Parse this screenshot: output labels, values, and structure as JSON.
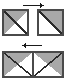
{
  "figure": {
    "canvas": {
      "width": 66,
      "height": 79
    },
    "background_color": "#ffffff"
  },
  "palette": {
    "shaded_fill": "#a8a8a8",
    "shaded_fill_light": "#b8b8b8",
    "empty_fill": "#ffffff",
    "stroke": "#4a4a4a",
    "stroke_dark": "#2b2b2b",
    "arrow_color": "#1a1a1a"
  },
  "shapes": [
    {
      "id": "top-left-square",
      "name": "square-diagonal-upper-left-shaded",
      "kind": "square",
      "x": 3,
      "y": 10,
      "width": 25,
      "height": 25,
      "diagonal": "top-left-to-bottom-right",
      "shaded_half": "upper-left",
      "fill_shaded": "#a8a8a8",
      "fill_empty": "#ffffff",
      "label": ""
    },
    {
      "id": "top-right-square",
      "name": "square-diagonal-upper-right-shaded",
      "kind": "square",
      "x": 38,
      "y": 10,
      "width": 25,
      "height": 25,
      "diagonal": "top-left-to-bottom-right",
      "shaded_half": "upper-right",
      "fill_shaded": "#a8a8a8",
      "fill_empty": "#ffffff",
      "label": ""
    },
    {
      "id": "bottom-rectangle",
      "name": "rectangle-double-triangle-v-pattern",
      "kind": "rectangle",
      "x": 3,
      "y": 52,
      "width": 60,
      "height": 25,
      "subdivision": "two-halves-each-split-by-diagonal",
      "pattern": "outer-triangles-shaded-inner-triangles-empty",
      "fill_shaded": "#a8a8a8",
      "fill_empty": "#ffffff",
      "label": ""
    }
  ],
  "arrows": [
    {
      "id": "top-arrow",
      "name": "arrow-right-top",
      "direction": "right",
      "x1": 23,
      "y1": 5,
      "x2": 43,
      "y2": 5,
      "color": "#1a1a1a",
      "label": ""
    },
    {
      "id": "middle-arrow",
      "name": "arrow-left-middle",
      "direction": "left",
      "x1": 42,
      "y1": 45,
      "x2": 22,
      "y2": 45,
      "color": "#1a1a1a",
      "label": ""
    }
  ],
  "annotations": {
    "labels": [],
    "caption": ""
  }
}
